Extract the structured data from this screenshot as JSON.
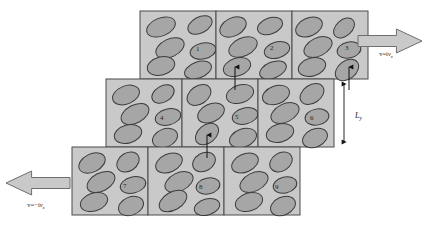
{
  "figure": {
    "background_color": "#ffffff",
    "cell_fill": "#c9c9c9",
    "cell_stroke": "#4a4a4a",
    "particle_fill": "#a6a6a6",
    "particle_stroke": "#3c3c3c",
    "arrow_fill": "#c9c9c9",
    "arrow_stroke": "#6e6e6e"
  },
  "chart_data": {
    "type": "diagram",
    "rows": 3,
    "cols": 3,
    "cell_count": 9,
    "cell_width": 76,
    "cell_height": 68,
    "row_offsets_x": [
      140,
      106,
      72
    ],
    "row_offsets_y": [
      11,
      79,
      147
    ],
    "grid": [
      {
        "row": 0,
        "origin_x": 140,
        "origin_y": 11,
        "cells": [
          {
            "number": "1",
            "x": 140,
            "label_x": 196,
            "label_y": 51,
            "particles": [
              {
                "cx": 161,
                "cy": 27,
                "rx": 15,
                "ry": 9,
                "angle": -22
              },
              {
                "cx": 200,
                "cy": 25,
                "rx": 13,
                "ry": 8,
                "angle": -28
              },
              {
                "cx": 170,
                "cy": 48,
                "rx": 15,
                "ry": 9,
                "angle": -25
              },
              {
                "cx": 203,
                "cy": 51,
                "rx": 13,
                "ry": 8,
                "angle": -12
              },
              {
                "cx": 161,
                "cy": 66,
                "rx": 14,
                "ry": 9,
                "angle": -15
              },
              {
                "cx": 198,
                "cy": 70,
                "rx": 14,
                "ry": 8,
                "angle": -20
              }
            ]
          },
          {
            "number": "2",
            "x": 216,
            "label_x": 270,
            "label_y": 50,
            "particles": [
              {
                "cx": 233,
                "cy": 27,
                "rx": 14,
                "ry": 9,
                "angle": -26
              },
              {
                "cx": 270,
                "cy": 26,
                "rx": 13,
                "ry": 8,
                "angle": -20
              },
              {
                "cx": 243,
                "cy": 47,
                "rx": 15,
                "ry": 9,
                "angle": -24
              },
              {
                "cx": 277,
                "cy": 50,
                "rx": 13,
                "ry": 8,
                "angle": -16
              },
              {
                "cx": 237,
                "cy": 67,
                "rx": 14,
                "ry": 9,
                "angle": -18
              },
              {
                "cx": 273,
                "cy": 70,
                "rx": 14,
                "ry": 8,
                "angle": -22
              }
            ]
          },
          {
            "number": "3",
            "x": 292,
            "label_x": 345,
            "label_y": 50,
            "particles": [
              {
                "cx": 309,
                "cy": 27,
                "rx": 14,
                "ry": 9,
                "angle": -24
              },
              {
                "cx": 344,
                "cy": 28,
                "rx": 12,
                "ry": 8,
                "angle": -42
              },
              {
                "cx": 318,
                "cy": 47,
                "rx": 15,
                "ry": 9,
                "angle": -26
              },
              {
                "cx": 349,
                "cy": 50,
                "rx": 12,
                "ry": 8,
                "angle": -12
              },
              {
                "cx": 312,
                "cy": 67,
                "rx": 14,
                "ry": 9,
                "angle": -16
              },
              {
                "cx": 347,
                "cy": 70,
                "rx": 13,
                "ry": 9,
                "angle": -38
              }
            ]
          }
        ]
      },
      {
        "row": 1,
        "origin_x": 106,
        "origin_y": 79,
        "cells": [
          {
            "number": "4",
            "x": 106,
            "label_x": 160,
            "label_y": 120,
            "particles": [
              {
                "cx": 126,
                "cy": 95,
                "rx": 14,
                "ry": 9,
                "angle": -22
              },
              {
                "cx": 163,
                "cy": 94,
                "rx": 12,
                "ry": 8,
                "angle": -30
              },
              {
                "cx": 135,
                "cy": 114,
                "rx": 15,
                "ry": 9,
                "angle": -28
              },
              {
                "cx": 168,
                "cy": 117,
                "rx": 13,
                "ry": 8,
                "angle": -14
              },
              {
                "cx": 128,
                "cy": 134,
                "rx": 14,
                "ry": 9,
                "angle": -16
              },
              {
                "cx": 165,
                "cy": 138,
                "rx": 13,
                "ry": 9,
                "angle": -22
              }
            ]
          },
          {
            "number": "5",
            "x": 182,
            "label_x": 235,
            "label_y": 119,
            "particles": [
              {
                "cx": 199,
                "cy": 95,
                "rx": 13,
                "ry": 9,
                "angle": -34
              },
              {
                "cx": 240,
                "cy": 94,
                "rx": 14,
                "ry": 9,
                "angle": -18
              },
              {
                "cx": 211,
                "cy": 113,
                "rx": 14,
                "ry": 9,
                "angle": -24
              },
              {
                "cx": 245,
                "cy": 116,
                "rx": 13,
                "ry": 8,
                "angle": -14
              },
              {
                "cx": 207,
                "cy": 134,
                "rx": 13,
                "ry": 9,
                "angle": -40
              },
              {
                "cx": 243,
                "cy": 138,
                "rx": 14,
                "ry": 9,
                "angle": -20
              }
            ]
          },
          {
            "number": "6",
            "x": 258,
            "label_x": 310,
            "label_y": 120,
            "particles": [
              {
                "cx": 276,
                "cy": 95,
                "rx": 14,
                "ry": 9,
                "angle": -20
              },
              {
                "cx": 312,
                "cy": 94,
                "rx": 13,
                "ry": 9,
                "angle": -34
              },
              {
                "cx": 285,
                "cy": 113,
                "rx": 15,
                "ry": 9,
                "angle": -26
              },
              {
                "cx": 317,
                "cy": 117,
                "rx": 12,
                "ry": 8,
                "angle": -10
              },
              {
                "cx": 280,
                "cy": 133,
                "rx": 14,
                "ry": 9,
                "angle": -16
              },
              {
                "cx": 315,
                "cy": 138,
                "rx": 13,
                "ry": 9,
                "angle": -24
              }
            ]
          }
        ]
      },
      {
        "row": 2,
        "origin_x": 72,
        "origin_y": 147,
        "cells": [
          {
            "number": "7",
            "x": 72,
            "label_x": 123,
            "label_y": 188,
            "particles": [
              {
                "cx": 92,
                "cy": 163,
                "rx": 14,
                "ry": 9,
                "angle": -26
              },
              {
                "cx": 128,
                "cy": 162,
                "rx": 12,
                "ry": 9,
                "angle": -34
              },
              {
                "cx": 101,
                "cy": 182,
                "rx": 15,
                "ry": 9,
                "angle": -28
              },
              {
                "cx": 133,
                "cy": 185,
                "rx": 13,
                "ry": 8,
                "angle": -14
              },
              {
                "cx": 94,
                "cy": 202,
                "rx": 14,
                "ry": 9,
                "angle": -18
              },
              {
                "cx": 131,
                "cy": 206,
                "rx": 13,
                "ry": 9,
                "angle": -22
              }
            ]
          },
          {
            "number": "8",
            "x": 148,
            "label_x": 199,
            "label_y": 189,
            "particles": [
              {
                "cx": 169,
                "cy": 163,
                "rx": 14,
                "ry": 9,
                "angle": -24
              },
              {
                "cx": 204,
                "cy": 162,
                "rx": 12,
                "ry": 9,
                "angle": -30
              },
              {
                "cx": 179,
                "cy": 182,
                "rx": 15,
                "ry": 9,
                "angle": -26
              },
              {
                "cx": 208,
                "cy": 186,
                "rx": 12,
                "ry": 8,
                "angle": -12
              },
              {
                "cx": 173,
                "cy": 201,
                "rx": 15,
                "ry": 9,
                "angle": -30
              },
              {
                "cx": 207,
                "cy": 207,
                "rx": 13,
                "ry": 8,
                "angle": -16
              }
            ]
          },
          {
            "number": "9",
            "x": 224,
            "label_x": 275,
            "label_y": 189,
            "particles": [
              {
                "cx": 245,
                "cy": 163,
                "rx": 14,
                "ry": 9,
                "angle": -24
              },
              {
                "cx": 281,
                "cy": 162,
                "rx": 12,
                "ry": 9,
                "angle": -32
              },
              {
                "cx": 254,
                "cy": 182,
                "rx": 15,
                "ry": 9,
                "angle": -26
              },
              {
                "cx": 285,
                "cy": 185,
                "rx": 12,
                "ry": 8,
                "angle": -14
              },
              {
                "cx": 249,
                "cy": 202,
                "rx": 14,
                "ry": 9,
                "angle": -18
              },
              {
                "cx": 283,
                "cy": 206,
                "rx": 13,
                "ry": 9,
                "angle": -24
              }
            ]
          }
        ]
      }
    ],
    "velocity_arrows": [
      {
        "id": "top-right-velocity",
        "direction": "right",
        "label_main": "v=i",
        "label_var": "v",
        "label_sub": "x",
        "label_text": "v=ivx",
        "label_x": 386,
        "label_y": 56,
        "x": 358,
        "y": 29,
        "width": 64,
        "height": 24
      },
      {
        "id": "bottom-left-velocity",
        "direction": "left",
        "label_main": "v=−i",
        "label_var": "v",
        "label_sub": "x",
        "label_text": "v=-ivx",
        "label_x": 36,
        "label_y": 207,
        "x": 6,
        "y": 171,
        "width": 64,
        "height": 24
      }
    ],
    "dimension": {
      "id": "Ly-dimension",
      "label_var": "L",
      "label_sub": "y",
      "label_text": "Ly",
      "label_x": 355,
      "label_y": 118,
      "line_x": 344,
      "line_y_top": 80,
      "line_y_bottom": 146
    },
    "link_arrows": [
      {
        "id": "link-2-to-5",
        "x": 235,
        "y_from": 90,
        "y_to": 67,
        "head": "up"
      },
      {
        "id": "link-3-to-6",
        "x": 349,
        "y_from": 90,
        "y_to": 67,
        "head": "up"
      },
      {
        "id": "link-5-to-8",
        "x": 207,
        "y_from": 158,
        "y_to": 135,
        "head": "up"
      }
    ]
  }
}
